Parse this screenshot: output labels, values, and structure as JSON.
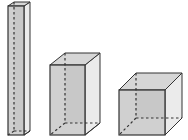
{
  "diagram": {
    "title": "",
    "colors": {
      "front_face": "#c8c8c8",
      "side_face": "#ebebeb",
      "top_face": "#d6d6d6",
      "edge": "#333333",
      "hidden_edge": "#333333"
    },
    "shapes": [
      {
        "name": "tall-rectangular-prism",
        "front": {
          "x1": 8,
          "y1": 6,
          "x2": 24,
          "y2": 135
        },
        "back": {
          "x1": 14,
          "y1": 2,
          "x2": 30,
          "y2": 131
        }
      },
      {
        "name": "medium-rectangular-prism",
        "front": {
          "x1": 50,
          "y1": 65,
          "x2": 85,
          "y2": 135
        },
        "back": {
          "x1": 65,
          "y1": 53,
          "x2": 100,
          "y2": 123
        }
      },
      {
        "name": "cube",
        "front": {
          "x1": 119,
          "y1": 90,
          "x2": 165,
          "y2": 135
        },
        "back": {
          "x1": 136,
          "y1": 73,
          "x2": 182,
          "y2": 118
        }
      }
    ]
  }
}
